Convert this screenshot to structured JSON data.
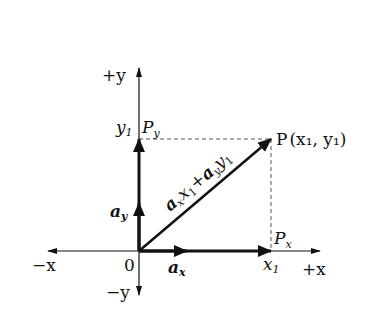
{
  "diagram": {
    "type": "vector-decomposition",
    "origin_label": "0",
    "axes": {
      "pos_x": "+x",
      "neg_x": "−x",
      "pos_y": "+y",
      "neg_y": "−y"
    },
    "point": {
      "name": "P",
      "coords": "(x₁, y₁)",
      "x_label": "x",
      "x_sub": "1",
      "y_label": "y",
      "y_sub": "1"
    },
    "projections": {
      "px_label": "P",
      "px_sub": "x",
      "py_label": "P",
      "py_sub": "y"
    },
    "unit_vectors": {
      "ax_label": "a",
      "ax_sub": "x",
      "ay_label": "a",
      "ay_sub": "y"
    },
    "resultant_label": {
      "t1": "a",
      "t1_sub": "x",
      "t2": "x",
      "t2_sub": "1",
      "plus": "+",
      "t3": "a",
      "t3_sub": "y",
      "t4": "y",
      "t4_sub": "1"
    }
  }
}
